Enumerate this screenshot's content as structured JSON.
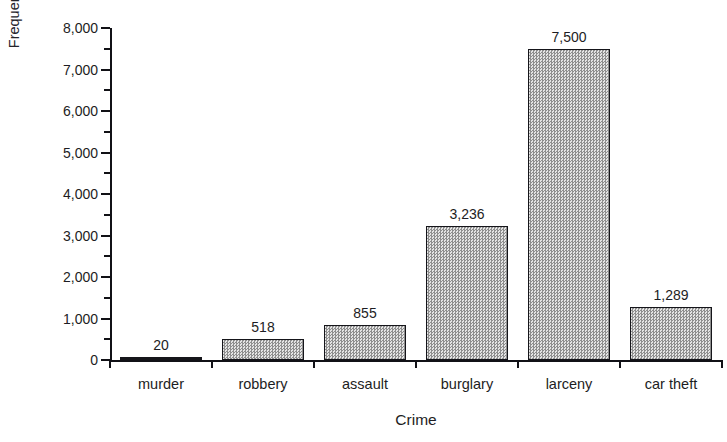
{
  "chart_data": {
    "type": "bar",
    "title": "",
    "xlabel": "Crime",
    "ylabel": "Frequency (in thousands)",
    "categories": [
      "murder",
      "robbery",
      "assault",
      "burglary",
      "larceny",
      "car theft"
    ],
    "values": [
      20,
      518,
      855,
      3236,
      7500,
      1289
    ],
    "value_labels": [
      "20",
      "518",
      "855",
      "3,236",
      "7,500",
      "1,289"
    ],
    "ylim": [
      0,
      8000
    ],
    "ytick_labels": [
      "0",
      "1,000",
      "2,000",
      "3,000",
      "4,000",
      "5,000",
      "6,000",
      "7,000",
      "8,000"
    ],
    "ytick_values": [
      0,
      1000,
      2000,
      3000,
      4000,
      5000,
      6000,
      7000,
      8000
    ],
    "yminor_values": [
      500,
      1500,
      2500,
      3500,
      4500,
      5500,
      6500,
      7500
    ],
    "grid": false,
    "legend": false,
    "bar_fill": "#b9b9b9",
    "bar_edge": "#15151a",
    "background": "#ffffff"
  },
  "figure": {
    "cropped_title": "",
    "axis_color": "#111116",
    "text_color": "#1d1d23"
  }
}
